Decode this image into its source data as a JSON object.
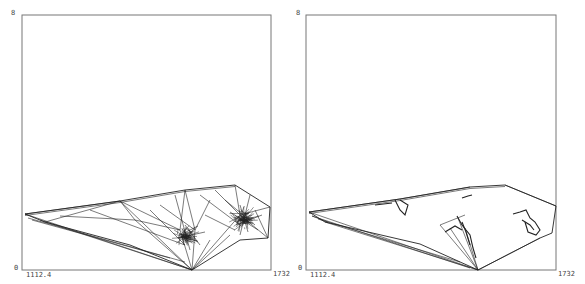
{
  "panels": [
    {
      "id": "left",
      "y_top_label": "8",
      "y_bottom_label": "0",
      "x_left_label": "1112.4",
      "x_right_label": "1732",
      "frame": {
        "x0": 22,
        "y0": 15,
        "x1": 271,
        "y1": 270
      },
      "outline": [
        [
          25,
          214
        ],
        [
          120,
          201
        ],
        [
          185,
          190
        ],
        [
          235,
          185
        ],
        [
          270,
          207
        ],
        [
          268,
          238
        ],
        [
          240,
          240
        ],
        [
          192,
          270
        ],
        [
          130,
          245
        ],
        [
          45,
          222
        ],
        [
          25,
          214
        ]
      ],
      "mesh_lines": [
        [
          [
            25,
            214
          ],
          [
            192,
            270
          ]
        ],
        [
          [
            25,
            214
          ],
          [
            120,
            201
          ]
        ],
        [
          [
            28,
            218
          ],
          [
            185,
            262
          ]
        ],
        [
          [
            32,
            220
          ],
          [
            170,
            258
          ]
        ],
        [
          [
            40,
            220
          ],
          [
            192,
            270
          ]
        ],
        [
          [
            120,
            201
          ],
          [
            192,
            270
          ]
        ],
        [
          [
            120,
            201
          ],
          [
            135,
            220
          ]
        ],
        [
          [
            135,
            220
          ],
          [
            192,
            270
          ]
        ],
        [
          [
            120,
            201
          ],
          [
            180,
            230
          ]
        ],
        [
          [
            180,
            230
          ],
          [
            192,
            270
          ]
        ],
        [
          [
            185,
            190
          ],
          [
            180,
            230
          ]
        ],
        [
          [
            185,
            190
          ],
          [
            195,
            230
          ]
        ],
        [
          [
            195,
            230
          ],
          [
            192,
            270
          ]
        ],
        [
          [
            210,
            200
          ],
          [
            195,
            230
          ]
        ],
        [
          [
            235,
            185
          ],
          [
            240,
            215
          ]
        ],
        [
          [
            240,
            215
          ],
          [
            192,
            270
          ]
        ],
        [
          [
            240,
            215
          ],
          [
            270,
            207
          ]
        ],
        [
          [
            240,
            215
          ],
          [
            268,
            238
          ]
        ],
        [
          [
            215,
            190
          ],
          [
            240,
            215
          ]
        ],
        [
          [
            200,
            195
          ],
          [
            240,
            225
          ]
        ],
        [
          [
            135,
            220
          ],
          [
            180,
            230
          ]
        ],
        [
          [
            150,
            210
          ],
          [
            185,
            245
          ]
        ],
        [
          [
            160,
            205
          ],
          [
            195,
            230
          ]
        ],
        [
          [
            175,
            195
          ],
          [
            190,
            250
          ]
        ],
        [
          [
            205,
            215
          ],
          [
            235,
            230
          ]
        ],
        [
          [
            225,
            200
          ],
          [
            255,
            225
          ]
        ],
        [
          [
            250,
            195
          ],
          [
            240,
            235
          ]
        ],
        [
          [
            255,
            210
          ],
          [
            268,
            238
          ]
        ],
        [
          [
            210,
            240
          ],
          [
            192,
            270
          ]
        ],
        [
          [
            230,
            235
          ],
          [
            192,
            270
          ]
        ],
        [
          [
            45,
            222
          ],
          [
            120,
            201
          ]
        ],
        [
          [
            60,
            216
          ],
          [
            135,
            220
          ]
        ],
        [
          [
            90,
            210
          ],
          [
            185,
            245
          ]
        ],
        [
          [
            185,
            225
          ],
          [
            200,
            245
          ]
        ],
        [
          [
            178,
            238
          ],
          [
            205,
            232
          ]
        ],
        [
          [
            230,
            212
          ],
          [
            258,
            230
          ]
        ],
        [
          [
            236,
            225
          ],
          [
            262,
            215
          ]
        ],
        [
          [
            186,
            232
          ],
          [
            198,
            226
          ]
        ],
        [
          [
            240,
            205
          ],
          [
            248,
            232
          ]
        ]
      ],
      "dense_clusters": [
        {
          "cx": 186,
          "cy": 236,
          "r": 9
        },
        {
          "cx": 244,
          "cy": 219,
          "r": 11
        }
      ]
    },
    {
      "id": "right",
      "y_top_label": "8",
      "y_bottom_label": "0",
      "x_left_label": "1112.4",
      "x_right_label": "1732",
      "frame": {
        "x0": 306,
        "y0": 15,
        "x1": 556,
        "y1": 270
      },
      "outline": [
        [
          309,
          212
        ],
        [
          400,
          199
        ],
        [
          470,
          187
        ],
        [
          505,
          185
        ],
        [
          556,
          206
        ],
        [
          552,
          233
        ],
        [
          540,
          238
        ],
        [
          478,
          270
        ],
        [
          420,
          244
        ],
        [
          325,
          222
        ],
        [
          309,
          212
        ]
      ],
      "mesh_lines": [
        [
          [
            309,
            212
          ],
          [
            478,
            270
          ]
        ],
        [
          [
            312,
            216
          ],
          [
            470,
            268
          ]
        ],
        [
          [
            318,
            219
          ],
          [
            460,
            262
          ]
        ],
        [
          [
            325,
            222
          ],
          [
            478,
            270
          ]
        ],
        [
          [
            309,
            212
          ],
          [
            400,
            199
          ]
        ],
        [
          [
            400,
            199
          ],
          [
            470,
            187
          ]
        ],
        [
          [
            312,
            216
          ],
          [
            328,
            222
          ]
        ],
        [
          [
            440,
            225
          ],
          [
            478,
            270
          ]
        ],
        [
          [
            458,
            218
          ],
          [
            478,
            270
          ]
        ],
        [
          [
            465,
            228
          ],
          [
            478,
            270
          ]
        ],
        [
          [
            440,
            225
          ],
          [
            465,
            215
          ]
        ],
        [
          [
            450,
            228
          ],
          [
            478,
            270
          ]
        ],
        [
          [
            540,
            238
          ],
          [
            478,
            270
          ]
        ],
        [
          [
            505,
            185
          ],
          [
            556,
            206
          ]
        ]
      ],
      "detail_strokes": [
        [
          [
            395,
            200
          ],
          [
            400,
            210
          ],
          [
            405,
            215
          ],
          [
            408,
            205
          ],
          [
            400,
            200
          ]
        ],
        [
          [
            457,
            216
          ],
          [
            462,
            225
          ],
          [
            470,
            235
          ],
          [
            473,
            248
          ],
          [
            476,
            258
          ]
        ],
        [
          [
            462,
            222
          ],
          [
            466,
            232
          ],
          [
            470,
            245
          ]
        ],
        [
          [
            445,
            232
          ],
          [
            455,
            226
          ],
          [
            462,
            230
          ]
        ],
        [
          [
            513,
            214
          ],
          [
            520,
            212
          ],
          [
            526,
            210
          ],
          [
            530,
            218
          ],
          [
            535,
            222
          ],
          [
            540,
            230
          ],
          [
            536,
            235
          ],
          [
            528,
            232
          ],
          [
            525,
            222
          ]
        ],
        [
          [
            522,
            220
          ],
          [
            530,
            225
          ],
          [
            534,
            230
          ]
        ],
        [
          [
            462,
            198
          ],
          [
            468,
            196
          ],
          [
            472,
            195
          ]
        ],
        [
          [
            375,
            205
          ],
          [
            392,
            203
          ]
        ]
      ]
    }
  ],
  "style": {
    "frame_color": "#777777",
    "mesh_color": "#222222",
    "label_color": "#444444"
  }
}
